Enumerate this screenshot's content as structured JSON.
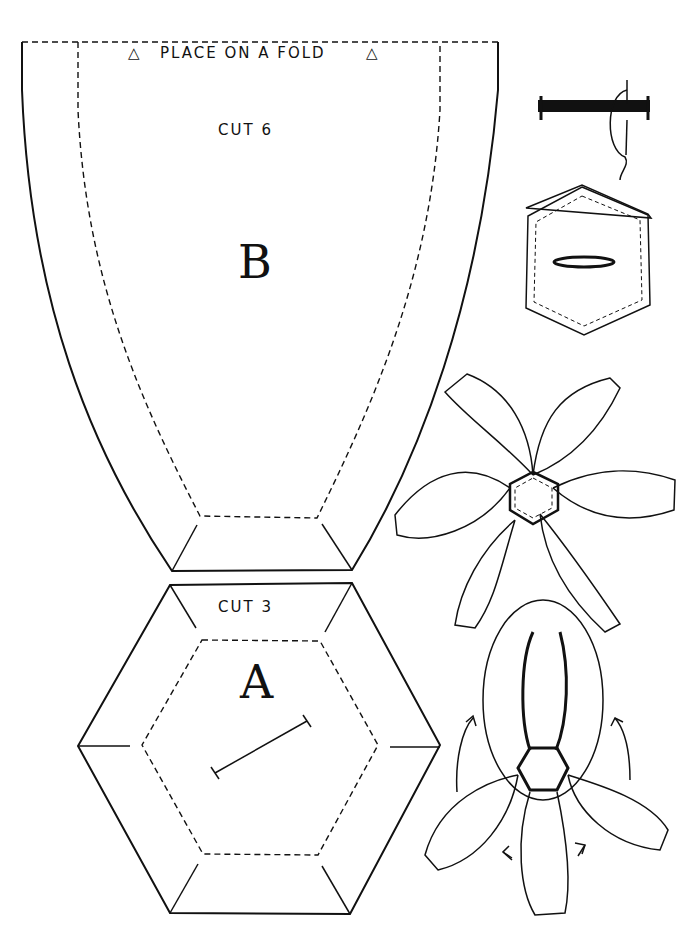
{
  "pattern_piece_b": {
    "fold_label": "PLACE ON A FOLD",
    "fold_marker_left": "△",
    "fold_marker_right": "△",
    "cut_label": "CUT 6",
    "letter": "B"
  },
  "pattern_piece_a": {
    "cut_label": "CUT 3",
    "letter": "A"
  },
  "illustrations": [
    "whip-stitch-detail",
    "hexagon-with-slit",
    "six-petal-flower-assembled-flat",
    "flower-petals-folding-up"
  ],
  "colors": {
    "line": "#111111",
    "paper": "#ffffff"
  }
}
